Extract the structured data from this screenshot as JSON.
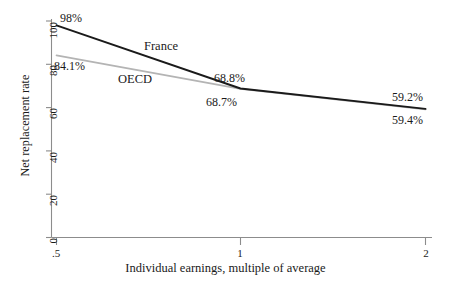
{
  "chart_data": {
    "type": "line",
    "title": "",
    "xlabel": "Individual earnings, multiple of average",
    "ylabel": "Net replacement rate",
    "x": [
      0.5,
      1,
      2
    ],
    "xtick_labels": [
      ".5",
      "1",
      "2"
    ],
    "ytick_labels": [
      "0",
      "20",
      "40",
      "60",
      "80",
      "100"
    ],
    "yticks": [
      0,
      20,
      40,
      60,
      80,
      100
    ],
    "ylim": [
      0,
      100
    ],
    "xlim": [
      0.5,
      2
    ],
    "grid": false,
    "legend_position": "inline-annotations",
    "series": [
      {
        "name": "France",
        "color": "#1a1a1a",
        "values": [
          98.0,
          68.8,
          59.4
        ],
        "point_labels": [
          "98%",
          "68.8%",
          "59.4%"
        ]
      },
      {
        "name": "OECD",
        "color": "#b4b4b4",
        "values": [
          84.1,
          68.7,
          59.2
        ],
        "point_labels": [
          "84.1%",
          "68.7%",
          "59.2%"
        ]
      }
    ],
    "annotations": [
      {
        "text": "98%",
        "series": "France"
      },
      {
        "text": "84.1%",
        "series": "OECD"
      },
      {
        "text": "68.8%",
        "series": "France"
      },
      {
        "text": "68.7%",
        "series": "OECD"
      },
      {
        "text": "59.2%",
        "series": "OECD"
      },
      {
        "text": "59.4%",
        "series": "France"
      },
      {
        "text": "France",
        "series": "France"
      },
      {
        "text": "OECD",
        "series": "OECD"
      }
    ]
  },
  "axes": {
    "y_title": "Net replacement rate",
    "x_title": "Individual earnings, multiple of average",
    "y_ticks": {
      "t0": "0",
      "t20": "20",
      "t40": "40",
      "t60": "60",
      "t80": "80",
      "t100": "100"
    },
    "x_ticks": {
      "t_half": ".5",
      "t_one": "1",
      "t_two": "2"
    }
  },
  "labels": {
    "france_series": "France",
    "oecd_series": "OECD",
    "france_at_half": "98%",
    "oecd_at_half": "84.1%",
    "france_at_one": "68.8%",
    "oecd_at_one": "68.7%",
    "oecd_at_two": "59.2%",
    "france_at_two": "59.4%"
  },
  "colors": {
    "france_line": "#1a1a1a",
    "oecd_line": "#b4b4b4",
    "axis": "#8c8c8c",
    "text": "#1a1a1a",
    "background": "#ffffff"
  }
}
